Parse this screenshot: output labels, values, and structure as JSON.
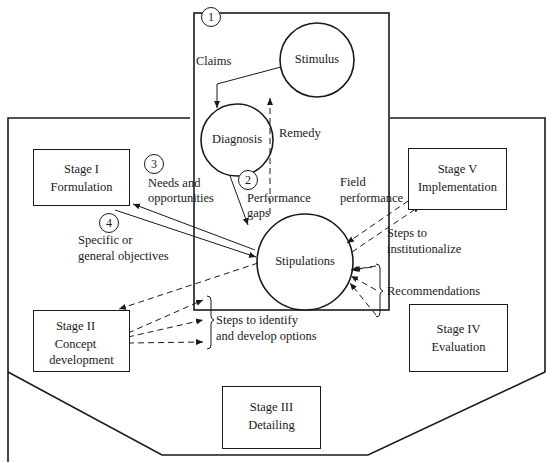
{
  "figure": {
    "caption_partial": "Figure (caption cut off at bottom edge)"
  },
  "nodes": {
    "stimulus": "Stimulus",
    "diagnosis": "Diagnosis",
    "stipulations": "Stipulations"
  },
  "stages": [
    {
      "id": "I",
      "title": "Stage I",
      "name": "Formulation"
    },
    {
      "id": "II",
      "title": "Stage II",
      "name_line1": "Concept",
      "name_line2": "development"
    },
    {
      "id": "III",
      "title": "Stage III",
      "name": "Detailing"
    },
    {
      "id": "IV",
      "title": "Stage IV",
      "name": "Evaluation"
    },
    {
      "id": "V",
      "title": "Stage V",
      "name": "Implementation"
    }
  ],
  "numbered_steps": [
    {
      "number": "1",
      "label": "Claims"
    },
    {
      "number": "2",
      "label_line1": "Performance",
      "label_line2": "gaps"
    },
    {
      "number": "3",
      "label_line1": "Needs and",
      "label_line2": "opportunities"
    },
    {
      "number": "4",
      "label_line1": "Specific or",
      "label_line2": "general objectives"
    }
  ],
  "flow_labels": {
    "remedy": "Remedy",
    "field_performance_line1": "Field",
    "field_performance_line2": "performance",
    "steps_institutionalize_line1": "Steps to",
    "steps_institutionalize_line2": "institutionalize",
    "recommendations": "Recommendations",
    "steps_identify_line1": "Steps to identify",
    "steps_identify_line2": "and develop options"
  }
}
